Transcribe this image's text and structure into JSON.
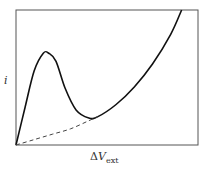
{
  "chart_data": {
    "type": "line",
    "title": "",
    "xlabel": "ΔV_ext",
    "ylabel": "i",
    "xlabel_parts": {
      "delta": "Δ",
      "var": "V",
      "sub": "ext"
    },
    "xlim": [
      0,
      1
    ],
    "ylim": [
      0,
      1
    ],
    "grid": false,
    "legend": null,
    "ticks": {
      "x": [],
      "y": []
    },
    "series": [
      {
        "name": "current (solid)",
        "style": "solid",
        "color": "#111111",
        "x": [
          0.0,
          0.05,
          0.1,
          0.15,
          0.18,
          0.22,
          0.27,
          0.33,
          0.4,
          0.45,
          0.55,
          0.65,
          0.75,
          0.85,
          0.91
        ],
        "y": [
          0.0,
          0.28,
          0.55,
          0.68,
          0.68,
          0.62,
          0.42,
          0.26,
          0.2,
          0.21,
          0.3,
          0.43,
          0.6,
          0.82,
          1.0
        ]
      },
      {
        "name": "baseline (dashed)",
        "style": "dashed",
        "color": "#444444",
        "x": [
          0.0,
          0.1,
          0.2,
          0.3,
          0.4,
          0.45
        ],
        "y": [
          0.0,
          0.04,
          0.08,
          0.12,
          0.18,
          0.21
        ]
      }
    ],
    "annotations": []
  },
  "frame": {
    "x0": 16,
    "y0": 10,
    "x1": 198,
    "y1": 145,
    "color": "#555555"
  }
}
